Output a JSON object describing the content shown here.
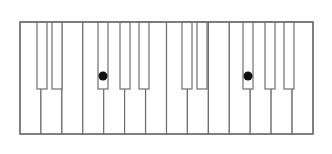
{
  "diagram": {
    "type": "piano-keyboard",
    "octaves": 2,
    "colors": {
      "background": "#ffffff",
      "key_fill": "#ffffff",
      "outline": "#6e6e6e",
      "marker": "#111111"
    },
    "frame": {
      "x": 20,
      "y": 22,
      "width": 293,
      "height": 112
    },
    "white_keys": [
      {
        "note": "C",
        "octave": 1,
        "x": 20.0
      },
      {
        "note": "D",
        "octave": 1,
        "x": 40.9
      },
      {
        "note": "E",
        "octave": 1,
        "x": 61.9
      },
      {
        "note": "F",
        "octave": 1,
        "x": 82.8
      },
      {
        "note": "G",
        "octave": 1,
        "x": 103.7
      },
      {
        "note": "A",
        "octave": 1,
        "x": 124.6
      },
      {
        "note": "B",
        "octave": 1,
        "x": 145.6
      },
      {
        "note": "C",
        "octave": 2,
        "x": 166.5
      },
      {
        "note": "D",
        "octave": 2,
        "x": 187.4
      },
      {
        "note": "E",
        "octave": 2,
        "x": 208.4
      },
      {
        "note": "F",
        "octave": 2,
        "x": 229.3
      },
      {
        "note": "G",
        "octave": 2,
        "x": 250.2
      },
      {
        "note": "A",
        "octave": 2,
        "x": 271.1
      },
      {
        "note": "B",
        "octave": 2,
        "x": 292.1
      }
    ],
    "white_key_width": 20.93,
    "black_keys": [
      {
        "note": "C#",
        "octave": 1,
        "x": 37,
        "width": 10,
        "marked": false
      },
      {
        "note": "D#",
        "octave": 1,
        "x": 52,
        "width": 10,
        "marked": false
      },
      {
        "note": "F#",
        "octave": 1,
        "x": 98,
        "width": 10,
        "marked": true
      },
      {
        "note": "G#",
        "octave": 1,
        "x": 120,
        "width": 10,
        "marked": false
      },
      {
        "note": "A#",
        "octave": 1,
        "x": 139,
        "width": 10,
        "marked": false
      },
      {
        "note": "C#",
        "octave": 2,
        "x": 182,
        "width": 10,
        "marked": false
      },
      {
        "note": "D#",
        "octave": 2,
        "x": 197,
        "width": 10,
        "marked": false
      },
      {
        "note": "F#",
        "octave": 2,
        "x": 243,
        "width": 10,
        "marked": true
      },
      {
        "note": "G#",
        "octave": 2,
        "x": 265,
        "width": 10,
        "marked": false
      },
      {
        "note": "A#",
        "octave": 2,
        "x": 284,
        "width": 10,
        "marked": false
      }
    ],
    "black_key_height": 67,
    "marker": {
      "radius": 4.5,
      "offset_y": 54
    },
    "marked_notes": [
      "F#",
      "F#"
    ]
  }
}
